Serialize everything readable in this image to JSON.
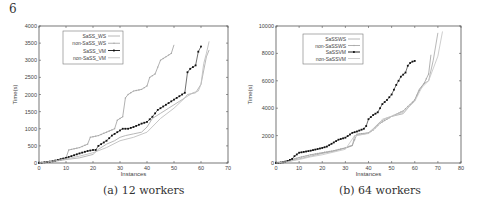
{
  "page_number": "6",
  "captions": [
    "(a) 12 workers",
    "(b) 64 workers"
  ],
  "chart_data": [
    {
      "type": "line",
      "title": "(a) 12 workers",
      "xlabel": "Instances",
      "ylabel": "Time(s)",
      "xlim": [
        0,
        70
      ],
      "ylim": [
        0,
        4000
      ],
      "xticks": [
        0,
        10,
        20,
        30,
        40,
        50,
        60,
        70
      ],
      "yticks": [
        0,
        500,
        1000,
        1500,
        2000,
        2500,
        3000,
        3500,
        4000
      ],
      "grid": false,
      "legend_position": "upper left",
      "series": [
        {
          "name": "SaSS_WS",
          "style": "line",
          "color": "#b0b0b0",
          "x": [
            0,
            5,
            10,
            15,
            20,
            22,
            25,
            28,
            30,
            32,
            35,
            38,
            40,
            42,
            45,
            48,
            50,
            52,
            54,
            55,
            58,
            60,
            62,
            63
          ],
          "y": [
            0,
            40,
            100,
            150,
            250,
            400,
            550,
            650,
            750,
            800,
            850,
            900,
            1050,
            1300,
            1450,
            1600,
            1700,
            1800,
            1900,
            2000,
            2050,
            2300,
            3100,
            3300
          ]
        },
        {
          "name": "non-SaSS_WS",
          "style": "line+marker",
          "color": "#a8a8a8",
          "x": [
            0,
            5,
            10,
            11,
            15,
            18,
            19,
            22,
            25,
            28,
            29,
            31,
            32,
            33,
            35,
            38,
            40,
            41,
            43,
            45,
            47,
            49,
            50
          ],
          "y": [
            0,
            60,
            150,
            380,
            450,
            550,
            750,
            800,
            900,
            1000,
            1250,
            1350,
            1900,
            2000,
            2100,
            2150,
            2250,
            2500,
            2600,
            3000,
            3100,
            3200,
            3450
          ]
        },
        {
          "name": "SaSS_VM",
          "style": "line+marker",
          "color": "#111111",
          "x": [
            0,
            5,
            10,
            12,
            15,
            18,
            20,
            21,
            22,
            25,
            27,
            29,
            31,
            33,
            35,
            38,
            40,
            42,
            44,
            46,
            48,
            50,
            52,
            54,
            55,
            56,
            57,
            58,
            59,
            60
          ],
          "y": [
            0,
            50,
            150,
            200,
            280,
            350,
            380,
            380,
            500,
            650,
            800,
            900,
            1000,
            1000,
            1050,
            1150,
            1200,
            1350,
            1550,
            1650,
            1750,
            1850,
            1950,
            2050,
            2650,
            2750,
            2800,
            2850,
            3250,
            3400
          ]
        },
        {
          "name": "non-SaSS_VM",
          "style": "line",
          "color": "#c0c0c0",
          "x": [
            0,
            5,
            10,
            15,
            20,
            25,
            30,
            35,
            40,
            45,
            50,
            54,
            57,
            59,
            60,
            61,
            62,
            63
          ],
          "y": [
            0,
            50,
            120,
            200,
            300,
            450,
            650,
            750,
            900,
            1300,
            1600,
            1900,
            2050,
            2100,
            2300,
            2900,
            3200,
            3550
          ]
        }
      ]
    },
    {
      "type": "line",
      "title": "(b) 64 workers",
      "xlabel": "Instances",
      "ylabel": "Time(s)",
      "xlim": [
        0,
        80
      ],
      "ylim": [
        0,
        10000
      ],
      "xticks": [
        0,
        10,
        20,
        30,
        40,
        50,
        60,
        70,
        80
      ],
      "yticks": [
        0,
        2000,
        4000,
        6000,
        8000,
        10000
      ],
      "grid": false,
      "legend_position": "upper left",
      "series": [
        {
          "name": "SaSSWS",
          "style": "line",
          "color": "#b0b0b0",
          "x": [
            0,
            5,
            10,
            15,
            20,
            25,
            30,
            33,
            34,
            38,
            40,
            42,
            45,
            48,
            50,
            55,
            58,
            60,
            62,
            64,
            66,
            68,
            70
          ],
          "y": [
            0,
            100,
            300,
            500,
            700,
            850,
            1100,
            1250,
            2000,
            2100,
            2200,
            2500,
            3000,
            3300,
            3400,
            3600,
            4200,
            4600,
            5400,
            5800,
            6000,
            7500,
            9500
          ]
        },
        {
          "name": "non-SaSSWS",
          "style": "line+marker",
          "color": "#a8a8a8",
          "x": [
            0,
            5,
            10,
            15,
            20,
            25,
            30,
            33,
            35,
            40,
            42,
            45,
            50,
            55,
            60,
            62,
            64,
            66,
            67
          ],
          "y": [
            0,
            150,
            400,
            600,
            750,
            900,
            1100,
            1300,
            2100,
            2200,
            2400,
            2900,
            3400,
            3800,
            4600,
            5300,
            5800,
            6500,
            7900
          ]
        },
        {
          "name": "SaSSVM",
          "style": "line+marker",
          "color": "#111111",
          "x": [
            0,
            3,
            5,
            7,
            8,
            10,
            15,
            20,
            22,
            25,
            27,
            30,
            33,
            35,
            38,
            39,
            40,
            42,
            44,
            46,
            48,
            50,
            52,
            54,
            56,
            57,
            58,
            59,
            60
          ],
          "y": [
            0,
            50,
            150,
            300,
            500,
            750,
            900,
            1100,
            1200,
            1500,
            1700,
            1850,
            2200,
            2300,
            2500,
            2700,
            3200,
            3500,
            3700,
            4300,
            4600,
            5000,
            5700,
            6300,
            6600,
            7100,
            7300,
            7400,
            7450
          ]
        },
        {
          "name": "non-SaSSVM",
          "style": "line",
          "color": "#c8c8c8",
          "x": [
            0,
            5,
            10,
            15,
            20,
            25,
            30,
            34,
            38,
            40,
            44,
            46,
            50,
            55,
            60,
            63,
            66,
            70,
            72
          ],
          "y": [
            0,
            100,
            250,
            450,
            600,
            800,
            1000,
            2000,
            2100,
            2150,
            2700,
            3200,
            3400,
            3700,
            4500,
            5500,
            6000,
            7800,
            9600
          ]
        }
      ]
    }
  ]
}
